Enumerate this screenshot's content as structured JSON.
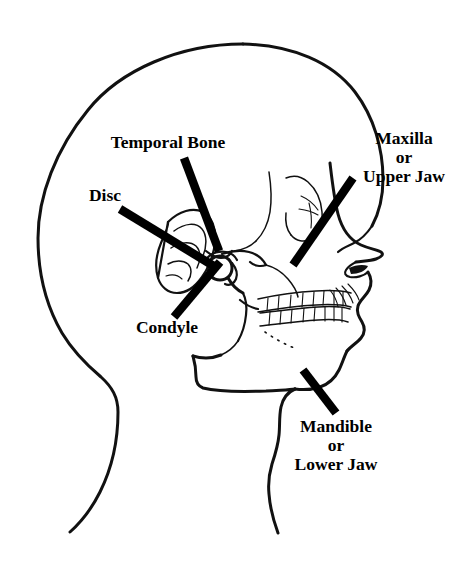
{
  "figure": {
    "background_color": "#ffffff",
    "line_color": "#111111",
    "pointer_color": "#000000",
    "width": 463,
    "height": 563
  },
  "labels": {
    "temporal_bone": {
      "text": "Temporal Bone",
      "lines": [
        "Temporal Bone"
      ],
      "x": 168,
      "y": 148
    },
    "disc": {
      "text": "Disc",
      "lines": [
        "Disc"
      ],
      "x": 105,
      "y": 201
    },
    "condyle": {
      "text": "Condyle",
      "lines": [
        "Condyle"
      ],
      "x": 167,
      "y": 333
    },
    "maxilla": {
      "text": "Maxilla or Upper Jaw",
      "lines": [
        "Maxilla",
        "or",
        "Upper Jaw"
      ],
      "line1": "Maxilla",
      "line2": "or",
      "line3": "Upper Jaw",
      "x": 404,
      "y": 144
    },
    "mandible": {
      "text": "Mandible or Lower Jaw",
      "lines": [
        "Mandible",
        "or",
        "Lower Jaw"
      ],
      "line1": "Mandible",
      "line2": "or",
      "line3": "Lower Jaw",
      "x": 336,
      "y": 432
    }
  },
  "pointers": {
    "temporal_bone": {
      "x1": 184,
      "y1": 158,
      "x2": 219,
      "y2": 251
    },
    "disc": {
      "x1": 120,
      "y1": 209,
      "x2": 216,
      "y2": 268
    },
    "condyle": {
      "x1": 175,
      "y1": 316,
      "x2": 219,
      "y2": 263
    },
    "maxilla": {
      "x1": 353,
      "y1": 178,
      "x2": 293,
      "y2": 265
    },
    "mandible": {
      "x1": 303,
      "y1": 371,
      "x2": 335,
      "y2": 412
    }
  },
  "anatomy_parts": [
    "skull-cranium-outline",
    "face-profile",
    "nose",
    "orbit-eye-socket",
    "zygomatic-arch",
    "ear-auricle",
    "condyle-head",
    "articular-disc",
    "mandible-ramus",
    "mandible-body",
    "upper-teeth-row",
    "lower-teeth-row",
    "neck-posterior",
    "neck-anterior",
    "lips-mouth"
  ]
}
